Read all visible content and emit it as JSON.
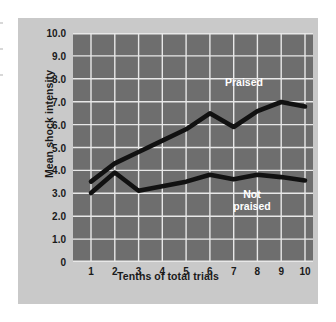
{
  "figure": {
    "background_color": "#ffffff",
    "card_color": "#c9c9c9",
    "plot_background_color": "#6e6e6e",
    "grid_color": "#e8e8e8",
    "line_color": "#111111",
    "label_color": "#ffffff"
  },
  "chart_data": {
    "type": "line",
    "title": "",
    "xlabel": "Tenths of total trials",
    "ylabel": "Mean shock intensity",
    "x": [
      1,
      2,
      3,
      4,
      5,
      6,
      7,
      8,
      9,
      10
    ],
    "xticklabels": [
      "1",
      "2",
      "3",
      "4",
      "5",
      "6",
      "7",
      "8",
      "9",
      "10"
    ],
    "yticks": [
      0,
      1.0,
      2.0,
      3.0,
      4.0,
      5.0,
      6.0,
      7.0,
      8.0,
      9.0,
      10.0
    ],
    "yticklabels": [
      "0",
      "1.0",
      "2.0",
      "3.0",
      "4.0",
      "5.0",
      "6.0",
      "7.0",
      "8.0",
      "9.0",
      "10.0"
    ],
    "xlim": [
      1,
      10
    ],
    "ylim": [
      0,
      10
    ],
    "grid": true,
    "legend_position": "inline-annotation",
    "series": [
      {
        "name": "Praised",
        "label": "Praised",
        "values": [
          3.5,
          4.3,
          4.8,
          5.3,
          5.8,
          6.5,
          5.9,
          6.6,
          7.0,
          6.8
        ]
      },
      {
        "name": "Not praised",
        "label": "Not\npraised",
        "values": [
          3.0,
          3.9,
          3.1,
          3.3,
          3.5,
          3.8,
          3.6,
          3.8,
          3.7,
          3.55
        ]
      }
    ],
    "annotations": [
      {
        "text": "Praised",
        "x": 7.1,
        "y": 7.7
      },
      {
        "text": "Not\npraised",
        "x": 7.5,
        "y": 2.75
      }
    ]
  }
}
